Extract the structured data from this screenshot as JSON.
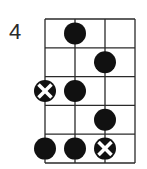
{
  "diagram": {
    "type": "fretboard-scale-diagram",
    "start_fret_label": "4",
    "strings": 4,
    "frets": 5,
    "colors": {
      "line": "#2a2a2a",
      "dot": "#111111",
      "x_mark": "#ffffff"
    },
    "markers": [
      {
        "fret": 1,
        "string": 2,
        "kind": "dot"
      },
      {
        "fret": 2,
        "string": 3,
        "kind": "dot"
      },
      {
        "fret": 3,
        "string": 1,
        "kind": "root-x"
      },
      {
        "fret": 3,
        "string": 2,
        "kind": "dot"
      },
      {
        "fret": 4,
        "string": 3,
        "kind": "dot"
      },
      {
        "fret": 5,
        "string": 1,
        "kind": "dot"
      },
      {
        "fret": 5,
        "string": 2,
        "kind": "dot"
      },
      {
        "fret": 5,
        "string": 3,
        "kind": "root-x"
      }
    ]
  }
}
